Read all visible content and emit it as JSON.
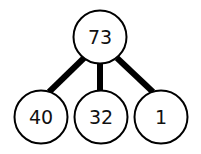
{
  "tree": {
    "root": {
      "label": "73",
      "cx": 100,
      "cy": 37
    },
    "children": [
      {
        "label": "40",
        "cx": 41,
        "cy": 117
      },
      {
        "label": "32",
        "cx": 101,
        "cy": 117
      },
      {
        "label": "1",
        "cx": 161,
        "cy": 117
      }
    ],
    "node_radius": 27,
    "edge_color": "#000000",
    "node_stroke": "#000000",
    "node_fill": "#ffffff"
  }
}
